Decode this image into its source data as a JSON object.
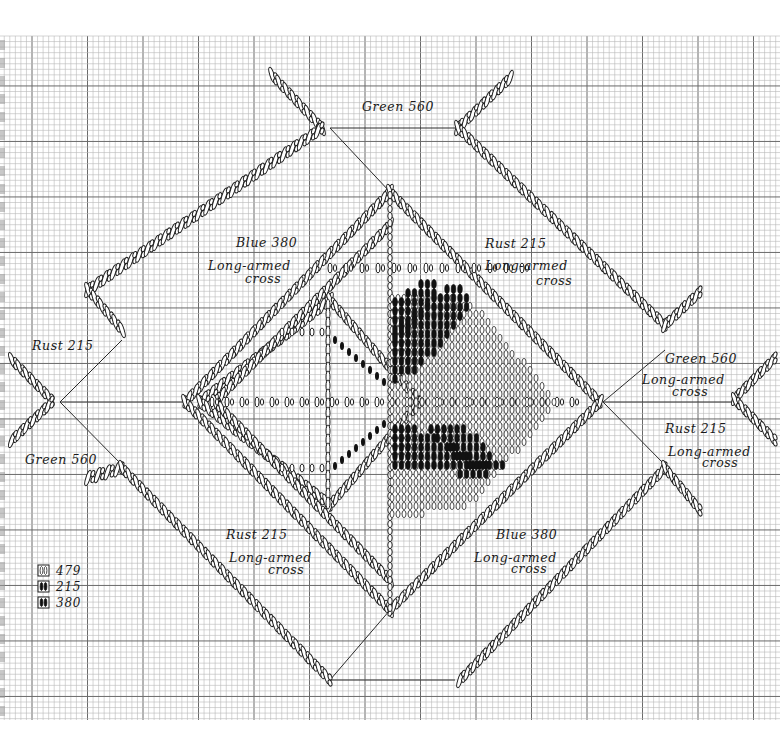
{
  "diagram": {
    "type": "needlepoint-stitch-chart",
    "background": "graph paper",
    "grid": {
      "origin_x": 0,
      "origin_y": 36,
      "right": 780,
      "bottom": 720,
      "cell": 5.55,
      "major_every": 10,
      "minor_color": "#b8b8b8",
      "major_color": "#6a6a6a"
    },
    "labels": [
      {
        "id": "green-560-top",
        "text": "Green 560",
        "x": 362,
        "y": 111
      },
      {
        "id": "blue-380-upper-left",
        "text": "Blue 380",
        "x": 236,
        "y": 247
      },
      {
        "id": "blue-380-upper-left-sub1",
        "text": "Long-armed",
        "x": 208,
        "y": 270
      },
      {
        "id": "blue-380-upper-left-sub2",
        "text": "cross",
        "x": 245,
        "y": 283
      },
      {
        "id": "rust-215-upper-right",
        "text": "Rust 215",
        "x": 485,
        "y": 248
      },
      {
        "id": "rust-215-upper-right-sub1",
        "text": "Long-armed",
        "x": 485,
        "y": 270
      },
      {
        "id": "rust-215-upper-right-sub2",
        "text": "cross",
        "x": 536,
        "y": 285
      },
      {
        "id": "rust-215-left",
        "text": "Rust 215",
        "x": 32,
        "y": 350
      },
      {
        "id": "green-560-left",
        "text": "Green 560",
        "x": 25,
        "y": 464
      },
      {
        "id": "green-560-right",
        "text": "Green 560",
        "x": 665,
        "y": 363
      },
      {
        "id": "green-560-right-sub1",
        "text": "Long-armed",
        "x": 642,
        "y": 384
      },
      {
        "id": "green-560-right-sub2",
        "text": "cross",
        "x": 672,
        "y": 396
      },
      {
        "id": "rust-215-right",
        "text": "Rust 215",
        "x": 665,
        "y": 433
      },
      {
        "id": "rust-215-right-sub1",
        "text": "Long-armed",
        "x": 668,
        "y": 456
      },
      {
        "id": "rust-215-right-sub2",
        "text": "cross",
        "x": 702,
        "y": 467
      },
      {
        "id": "rust-215-lower-left",
        "text": "Rust 215",
        "x": 226,
        "y": 539
      },
      {
        "id": "rust-215-lower-left-sub1",
        "text": "Long-armed",
        "x": 229,
        "y": 562
      },
      {
        "id": "rust-215-lower-left-sub2",
        "text": "cross",
        "x": 268,
        "y": 574
      },
      {
        "id": "blue-380-lower-right",
        "text": "Blue 380",
        "x": 496,
        "y": 539
      },
      {
        "id": "blue-380-lower-right-sub1",
        "text": "Long-armed",
        "x": 474,
        "y": 562
      },
      {
        "id": "blue-380-lower-right-sub2",
        "text": "cross",
        "x": 511,
        "y": 573
      }
    ],
    "legend": [
      {
        "symbol": "double-open-oval",
        "code": "479"
      },
      {
        "symbol": "half-filled-oval",
        "code": "215"
      },
      {
        "symbol": "filled-oval",
        "code": "380"
      }
    ],
    "threads": [
      {
        "color_name": "Green",
        "code": "560"
      },
      {
        "color_name": "Blue",
        "code": "380"
      },
      {
        "color_name": "Rust",
        "code": "215"
      }
    ],
    "stitch_name": "Long-armed cross",
    "colors": {
      "ink": "#1e1e1e",
      "paper": "#ffffff",
      "fill": "#111111"
    }
  }
}
